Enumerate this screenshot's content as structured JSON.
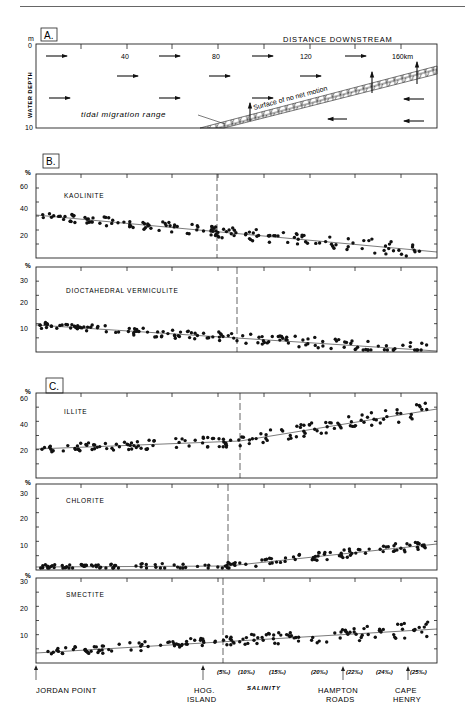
{
  "running_header": {
    "text": "5. Estuaries and Deltas   171"
  },
  "panel_a": {
    "label": "A.",
    "title": "DISTANCE DOWNSTREAM",
    "y_unit": "m",
    "y_axis_label": "WATER DEPTH",
    "y_ticks": [
      "0",
      "10"
    ],
    "x_ticks": [
      "40",
      "80",
      "120",
      "160km"
    ],
    "annotation_tidal": "tidal migration range",
    "annotation_surface": "Surface of no net motion"
  },
  "panel_b": {
    "label": "B.",
    "kaolinite": {
      "name": "KAOLINITE",
      "unit": "%",
      "y_ticks": [
        "60",
        "40",
        "20"
      ]
    },
    "vermiculite": {
      "name": "DIOCTAHEDRAL VERMICULITE",
      "unit": "%",
      "y_ticks": [
        "30",
        "20",
        "10"
      ]
    }
  },
  "panel_c": {
    "label": "C.",
    "illite": {
      "name": "ILLITE",
      "unit": "%",
      "y_ticks": [
        "60",
        "40",
        "20"
      ]
    },
    "chlorite": {
      "name": "CHLORITE",
      "unit": "%",
      "y_ticks": [
        "30",
        "20",
        "10"
      ]
    },
    "smectite": {
      "name": "SMECTITE",
      "unit": "%",
      "y_ticks": [
        "30",
        "20",
        "10"
      ]
    }
  },
  "bottom_axis": {
    "salinity_label": "SALINITY",
    "salinity_ticks": [
      "(5‰)",
      "(10‰)",
      "(15‰)",
      "(20‰)",
      "(22‰)",
      "(24‰)",
      "(25‰)"
    ],
    "locations": [
      "JORDAN POINT",
      "HOG.",
      "ISLAND",
      "HAMPTON",
      "ROADS",
      "CAPE",
      "HENRY"
    ]
  },
  "chart_data": [
    {
      "type": "diagram",
      "title": "A. Distance downstream vs water depth (estuarine circulation)",
      "xlabel": "DISTANCE DOWNSTREAM (km)",
      "ylabel": "WATER DEPTH (m)",
      "x_ticks": [
        40,
        80,
        120,
        160
      ],
      "ylim": [
        0,
        10
      ],
      "annotations": [
        "tidal migration range",
        "Surface of no net motion"
      ]
    },
    {
      "type": "scatter",
      "title": "KAOLINITE",
      "ylabel": "%",
      "ylim": [
        0,
        65
      ],
      "trend": {
        "start": 34,
        "end": 9
      },
      "x_range_km": [
        0,
        175
      ]
    },
    {
      "type": "scatter",
      "title": "DIOCTAHEDRAL VERMICULITE",
      "ylabel": "%",
      "ylim": [
        0,
        32
      ],
      "trend": {
        "start": 11,
        "end": 1
      },
      "x_range_km": [
        0,
        175
      ]
    },
    {
      "type": "scatter",
      "title": "ILLITE",
      "ylabel": "%",
      "ylim": [
        0,
        65
      ],
      "trend": {
        "start": 22,
        "end": 51
      },
      "x_range_km": [
        0,
        175
      ]
    },
    {
      "type": "scatter",
      "title": "CHLORITE",
      "ylabel": "%",
      "ylim": [
        0,
        32
      ],
      "trend": {
        "start": 1.5,
        "end": 10
      },
      "x_range_km": [
        0,
        175
      ]
    },
    {
      "type": "scatter",
      "title": "SMECTITE",
      "ylabel": "%",
      "ylim": [
        0,
        32
      ],
      "trend": {
        "start": 3.5,
        "end": 12.5
      },
      "x_range_km": [
        0,
        175
      ],
      "x_annotations": [
        "JORDAN POINT",
        "HOG. ISLAND",
        "SALINITY (5‰)(10‰)(15‰)(20‰)(22‰)(24‰)(25‰)",
        "HAMPTON ROADS",
        "CAPE HENRY"
      ]
    }
  ]
}
